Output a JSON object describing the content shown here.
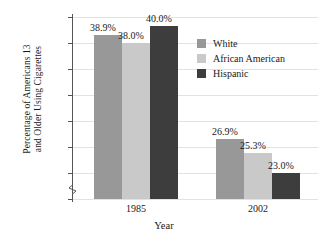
{
  "chart_data": {
    "type": "bar",
    "title": "",
    "xlabel": "Year",
    "ylabel": "Percentage of Americans 13 and Older Using Cigarettes",
    "ylabel_lines": [
      "Percentage of Americans 13",
      "and Older Using Cigarettes"
    ],
    "categories": [
      "1985",
      "2002"
    ],
    "series": [
      {
        "name": "White",
        "values": [
          38.9,
          26.9
        ],
        "color": "#989898"
      },
      {
        "name": "African American",
        "values": [
          38.0,
          25.3
        ],
        "color": "#c9c9c9"
      },
      {
        "name": "Hispanic",
        "values": [
          40.0,
          23.0
        ],
        "color": "#3d3d3d"
      }
    ],
    "value_labels": [
      [
        "38.9%",
        "38.0%",
        "40.0%"
      ],
      [
        "26.9%",
        "25.3%",
        "23.0%"
      ]
    ],
    "yticks": [
      20,
      23,
      26,
      29,
      32,
      35,
      38,
      41
    ],
    "ytick_labels": [
      "20%",
      "23%",
      "26%",
      "29%",
      "32%",
      "35%",
      "38%",
      "41%"
    ],
    "ylim": [
      20,
      41
    ],
    "axis_break": true,
    "grid": true,
    "legend_position": "upper-right"
  },
  "legend": {
    "items": [
      {
        "label": "White"
      },
      {
        "label": "African American"
      },
      {
        "label": "Hispanic"
      }
    ]
  }
}
